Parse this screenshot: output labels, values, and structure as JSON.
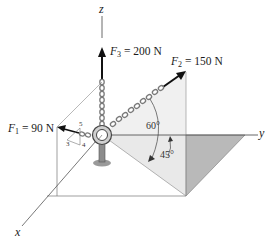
{
  "figure": {
    "axes": {
      "x": "x",
      "y": "y",
      "z": "z"
    },
    "forces": [
      {
        "symbol": "F",
        "subscript": "1",
        "value": "90 N",
        "label_eq": "="
      },
      {
        "symbol": "F",
        "subscript": "2",
        "value": "150 N",
        "label_eq": "="
      },
      {
        "symbol": "F",
        "subscript": "3",
        "value": "200 N",
        "label_eq": "="
      }
    ],
    "angles": {
      "a60": "60°",
      "a45": "45°"
    },
    "slope_triangle": {
      "hyp": "5",
      "rise": "3",
      "run": "4"
    },
    "colors": {
      "line": "#555555",
      "shade_dark": "#b9b9b9",
      "shade_light": "#ececec",
      "chain": "#8a8a8a",
      "arrow": "#111111"
    }
  }
}
